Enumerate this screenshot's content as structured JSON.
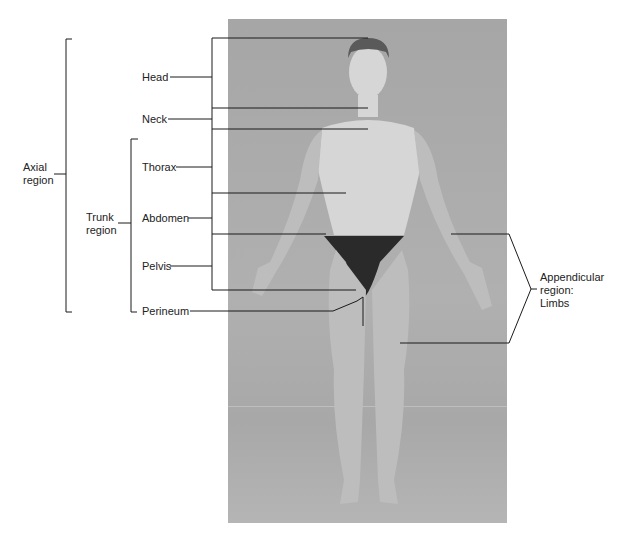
{
  "figure": {
    "background_color": "#ffffff",
    "photo_background": "#a9a9a9",
    "line_color": "#1a1a1a"
  },
  "labels": {
    "axial": "Axial\nregion",
    "trunk": "Trunk\nregion",
    "head": "Head",
    "neck": "Neck",
    "thorax": "Thorax",
    "abdomen": "Abdomen",
    "pelvis": "Pelvis",
    "perineum": "Perineum",
    "appendicular": "Appendicular\nregion:\nLimbs"
  },
  "hierarchy": {
    "axial_region": {
      "label": "Axial region",
      "children": [
        "Head",
        "Neck",
        "Trunk region"
      ]
    },
    "trunk_region": {
      "label": "Trunk region",
      "children": [
        "Thorax",
        "Abdomen",
        "Pelvis",
        "Perineum"
      ]
    },
    "appendicular_region": {
      "label": "Appendicular region: Limbs",
      "children": [
        "Upper limb",
        "Lower limb"
      ]
    }
  }
}
